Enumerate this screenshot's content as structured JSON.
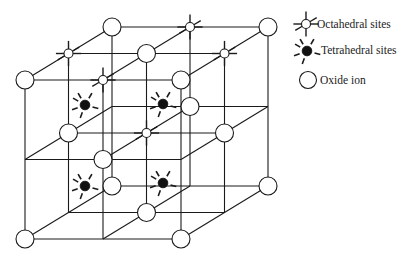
{
  "diagram": {
    "colors": {
      "line": "#1a1a1a",
      "oxide_fill": "#ffffff",
      "tetrahedral_fill": "#111111",
      "octahedral_fill": "#ffffff",
      "background": "#ffffff"
    },
    "projection": {
      "origin": [
        25,
        80
      ],
      "step_x": [
        78,
        0
      ],
      "step_y": [
        0,
        79.5
      ],
      "step_depth": [
        43.5,
        -26.5
      ]
    },
    "lattice_size": 2,
    "oxide_ions": [
      [
        0,
        0,
        0
      ],
      [
        2,
        0,
        0
      ],
      [
        1,
        1,
        0
      ],
      [
        0,
        2,
        0
      ],
      [
        2,
        2,
        0
      ],
      [
        1,
        0,
        1
      ],
      [
        0,
        1,
        1
      ],
      [
        2,
        1,
        1
      ],
      [
        1,
        2,
        1
      ],
      [
        0,
        0,
        2
      ],
      [
        2,
        0,
        2
      ],
      [
        1,
        1,
        2
      ],
      [
        0,
        2,
        2
      ],
      [
        2,
        2,
        2
      ]
    ],
    "octahedral_sites": [
      [
        1,
        0,
        0
      ],
      [
        0,
        0,
        1
      ],
      [
        2,
        0,
        1
      ],
      [
        1,
        1,
        1
      ],
      [
        1,
        0,
        2
      ]
    ],
    "tetrahedral_sites": [
      {
        "pos": [
          85,
          105
        ]
      },
      {
        "pos": [
          163,
          104
        ]
      },
      {
        "pos": [
          85,
          186
        ]
      },
      {
        "pos": [
          163,
          183
        ]
      }
    ]
  },
  "legend": {
    "items": [
      {
        "symbol": "octahedral",
        "label": "Octahedral sites"
      },
      {
        "symbol": "tetrahedral",
        "label": "Tetrahedral sites"
      },
      {
        "symbol": "oxide",
        "label": "Oxide ion"
      }
    ]
  }
}
